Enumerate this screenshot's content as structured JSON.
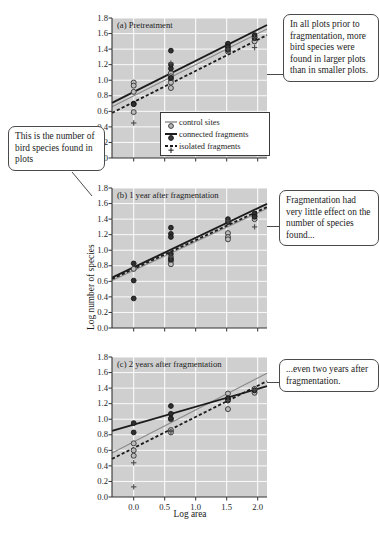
{
  "figure": {
    "cropped_top_text": "",
    "cropped_caption_text": "",
    "axis_label_x": "Log area",
    "axis_label_y": "Log number of species"
  },
  "legend": {
    "items": [
      {
        "label": "control sites",
        "symbol": "open-circle-thin-line"
      },
      {
        "label": "connected fragments",
        "symbol": "filled-circle-thick-line"
      },
      {
        "label": "isolated fragments",
        "symbol": "plus-dashed-line"
      }
    ]
  },
  "callouts": {
    "top_right": "In all plots prior to fragmentation, more bird species were found in larger plots than in smaller plots.",
    "middle_right": "Fragmentation had very little effect on the number of species found...",
    "bottom_right": "...even two years after fragmentation.",
    "left": "This is the number of bird species found in plots"
  },
  "chart_data": [
    {
      "type": "scatter",
      "panel": "a",
      "title": "(a) Pretreatment",
      "xlabel": "Log area",
      "ylabel": "Log number of species",
      "xlim": [
        -0.35,
        2.15
      ],
      "ylim": [
        0.0,
        1.8
      ],
      "xticks": [
        0.0,
        0.5,
        1.0,
        1.5,
        2.0
      ],
      "yticks": [
        0.0,
        0.2,
        0.4,
        0.6,
        0.8,
        1.0,
        1.2,
        1.4,
        1.6,
        1.8
      ],
      "grid": true,
      "grid_color": "#ffffff",
      "panel_background": "#cfcfcf",
      "series": [
        {
          "name": "control sites",
          "marker": "open-circle",
          "color": "#8a8a8a",
          "points": [
            {
              "x": 0.0,
              "y": 0.97
            },
            {
              "x": 0.0,
              "y": 0.93
            },
            {
              "x": 0.0,
              "y": 0.85
            },
            {
              "x": 0.0,
              "y": 0.59
            },
            {
              "x": 0.6,
              "y": 1.09
            },
            {
              "x": 0.6,
              "y": 1.05
            },
            {
              "x": 0.6,
              "y": 1.01
            },
            {
              "x": 0.6,
              "y": 0.97
            },
            {
              "x": 0.6,
              "y": 0.9
            },
            {
              "x": 1.52,
              "y": 1.46
            },
            {
              "x": 1.52,
              "y": 1.41
            },
            {
              "x": 1.52,
              "y": 1.37
            },
            {
              "x": 1.95,
              "y": 1.56
            },
            {
              "x": 1.95,
              "y": 1.5
            }
          ],
          "fit_line": {
            "intercept": 0.8,
            "slope": 0.4,
            "style": "solid-thin",
            "color": "#8a8a8a"
          }
        },
        {
          "name": "connected fragments",
          "marker": "filled-circle",
          "color": "#2a2a2a",
          "points": [
            {
              "x": 0.0,
              "y": 0.7
            },
            {
              "x": 0.0,
              "y": 0.69
            },
            {
              "x": 0.6,
              "y": 1.2
            },
            {
              "x": 0.6,
              "y": 1.15
            },
            {
              "x": 0.6,
              "y": 1.03
            },
            {
              "x": 0.6,
              "y": 1.38
            },
            {
              "x": 1.52,
              "y": 1.47
            },
            {
              "x": 1.52,
              "y": 1.43
            },
            {
              "x": 1.52,
              "y": 1.39
            },
            {
              "x": 1.95,
              "y": 1.58
            },
            {
              "x": 1.95,
              "y": 1.54
            }
          ],
          "fit_line": {
            "intercept": 0.85,
            "slope": 0.4,
            "style": "solid-thick",
            "color": "#1c1c1c"
          }
        },
        {
          "name": "isolated fragments",
          "marker": "plus",
          "color": "#4a4a4a",
          "points": [
            {
              "x": 0.0,
              "y": 0.45
            },
            {
              "x": 0.6,
              "y": 1.22
            },
            {
              "x": 1.52,
              "y": 1.4
            },
            {
              "x": 1.95,
              "y": 1.42
            },
            {
              "x": 1.95,
              "y": 1.55
            }
          ],
          "fit_line": {
            "intercept": 0.72,
            "slope": 0.4,
            "style": "dashed",
            "color": "#1c1c1c"
          }
        }
      ]
    },
    {
      "type": "scatter",
      "panel": "b",
      "title": "(b) 1 year after fragmentation",
      "xlabel": "Log area",
      "ylabel": "Log number of species",
      "xlim": [
        -0.35,
        2.15
      ],
      "ylim": [
        0.0,
        1.8
      ],
      "xticks": [
        0.0,
        0.5,
        1.0,
        1.5,
        2.0
      ],
      "yticks": [
        0.0,
        0.2,
        0.4,
        0.6,
        0.8,
        1.0,
        1.2,
        1.4,
        1.6,
        1.8
      ],
      "grid": true,
      "grid_color": "#ffffff",
      "panel_background": "#cfcfcf",
      "series": [
        {
          "name": "control sites",
          "marker": "open-circle",
          "color": "#8a8a8a",
          "points": [
            {
              "x": 0.0,
              "y": 0.76
            },
            {
              "x": 0.6,
              "y": 0.9
            },
            {
              "x": 0.6,
              "y": 0.86
            },
            {
              "x": 0.6,
              "y": 0.82
            },
            {
              "x": 1.52,
              "y": 1.22
            },
            {
              "x": 1.52,
              "y": 1.17
            },
            {
              "x": 1.52,
              "y": 1.14
            },
            {
              "x": 1.95,
              "y": 1.44
            },
            {
              "x": 1.95,
              "y": 1.4
            }
          ],
          "fit_line": {
            "intercept": 0.74,
            "slope": 0.37,
            "style": "solid-thin",
            "color": "#8a8a8a"
          }
        },
        {
          "name": "connected fragments",
          "marker": "filled-circle",
          "color": "#2a2a2a",
          "points": [
            {
              "x": 0.0,
              "y": 0.83
            },
            {
              "x": 0.0,
              "y": 0.61
            },
            {
              "x": 0.0,
              "y": 0.38
            },
            {
              "x": 0.6,
              "y": 1.29
            },
            {
              "x": 0.6,
              "y": 1.21
            },
            {
              "x": 0.6,
              "y": 1.17
            },
            {
              "x": 0.6,
              "y": 0.95
            },
            {
              "x": 0.6,
              "y": 0.88
            },
            {
              "x": 1.52,
              "y": 1.4
            },
            {
              "x": 1.52,
              "y": 1.36
            },
            {
              "x": 1.95,
              "y": 1.47
            },
            {
              "x": 1.95,
              "y": 1.43
            }
          ],
          "fit_line": {
            "intercept": 0.78,
            "slope": 0.38,
            "style": "solid-thick",
            "color": "#1c1c1c"
          }
        },
        {
          "name": "isolated fragments",
          "marker": "plus",
          "color": "#4a4a4a",
          "points": [
            {
              "x": 0.6,
              "y": 0.92
            },
            {
              "x": 1.52,
              "y": 1.38
            },
            {
              "x": 1.95,
              "y": 1.3
            }
          ],
          "fit_line": {
            "intercept": 0.76,
            "slope": 0.37,
            "style": "dashed",
            "color": "#1c1c1c"
          }
        }
      ]
    },
    {
      "type": "scatter",
      "panel": "c",
      "title": "(c) 2 years after fragmentation",
      "xlabel": "Log area",
      "ylabel": "Log number of species",
      "xlim": [
        -0.35,
        2.15
      ],
      "ylim": [
        0.0,
        1.8
      ],
      "xticks": [
        0.0,
        0.5,
        1.0,
        1.5,
        2.0
      ],
      "yticks": [
        0.0,
        0.2,
        0.4,
        0.6,
        0.8,
        1.0,
        1.2,
        1.4,
        1.6,
        1.8
      ],
      "grid": true,
      "grid_color": "#ffffff",
      "panel_background": "#cfcfcf",
      "series": [
        {
          "name": "control sites",
          "marker": "open-circle",
          "color": "#8a8a8a",
          "points": [
            {
              "x": 0.0,
              "y": 0.69
            },
            {
              "x": 0.0,
              "y": 0.6
            },
            {
              "x": 0.0,
              "y": 0.53
            },
            {
              "x": 0.6,
              "y": 1.0
            },
            {
              "x": 0.6,
              "y": 0.86
            },
            {
              "x": 0.6,
              "y": 0.83
            },
            {
              "x": 1.52,
              "y": 1.33
            },
            {
              "x": 1.52,
              "y": 1.25
            },
            {
              "x": 1.52,
              "y": 1.13
            },
            {
              "x": 1.95,
              "y": 1.39
            },
            {
              "x": 1.95,
              "y": 1.34
            }
          ],
          "fit_line": {
            "intercept": 0.71,
            "slope": 0.41,
            "style": "solid-thin",
            "color": "#8a8a8a"
          }
        },
        {
          "name": "connected fragments",
          "marker": "filled-circle",
          "color": "#2a2a2a",
          "points": [
            {
              "x": 0.0,
              "y": 0.95
            },
            {
              "x": 0.0,
              "y": 0.83
            },
            {
              "x": 0.6,
              "y": 1.17
            },
            {
              "x": 0.6,
              "y": 1.07
            },
            {
              "x": 0.6,
              "y": 1.01
            },
            {
              "x": 1.52,
              "y": 1.27
            },
            {
              "x": 1.52,
              "y": 1.24
            },
            {
              "x": 1.95,
              "y": 1.37
            }
          ],
          "fit_line": {
            "intercept": 0.93,
            "slope": 0.23,
            "style": "solid-thick",
            "color": "#1c1c1c"
          }
        },
        {
          "name": "isolated fragments",
          "marker": "plus",
          "color": "#4a4a4a",
          "points": [
            {
              "x": 0.0,
              "y": 0.44
            },
            {
              "x": 0.0,
              "y": 0.13
            },
            {
              "x": 0.6,
              "y": 0.84
            },
            {
              "x": 1.52,
              "y": 1.24
            },
            {
              "x": 1.95,
              "y": 1.38
            }
          ],
          "fit_line": {
            "intercept": 0.63,
            "slope": 0.4,
            "style": "dashed",
            "color": "#1c1c1c"
          }
        }
      ]
    }
  ]
}
